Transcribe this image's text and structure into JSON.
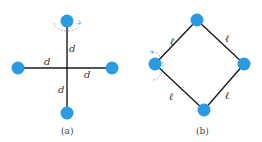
{
  "figure_a": {
    "caption": "(a)",
    "arm_labels": [
      "d",
      "d",
      "d",
      "d"
    ],
    "center": [
      67,
      68
    ],
    "masses": [
      [
        67,
        21
      ],
      [
        18,
        68
      ],
      [
        112,
        68
      ],
      [
        67,
        113
      ]
    ],
    "rotation_arrow_at": "top"
  },
  "figure_b": {
    "caption": "(b)",
    "side_labels": [
      "ℓ",
      "ℓ",
      "ℓ",
      "ℓ"
    ],
    "masses": [
      [
        197,
        20
      ],
      [
        155,
        64
      ],
      [
        244,
        64
      ],
      [
        204,
        110
      ]
    ],
    "rotation_arrow_at": "left"
  },
  "colors": {
    "mass": "#2a9be3",
    "rod": "#1a1a1a",
    "arrow": "#5aa8de"
  }
}
